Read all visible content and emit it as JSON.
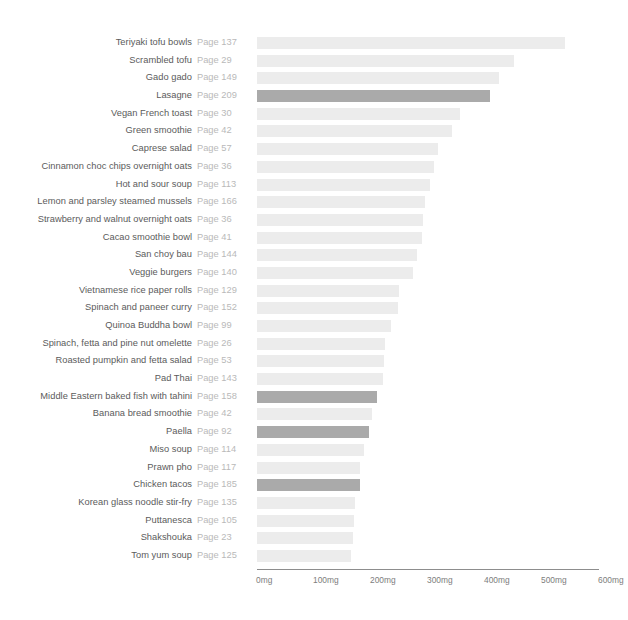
{
  "chart_data": {
    "type": "bar",
    "orientation": "horizontal",
    "title": "",
    "xlabel": "",
    "ylabel": "",
    "xlim": [
      0,
      600
    ],
    "unit": "mg",
    "grid": false,
    "legend": null,
    "axis": {
      "ticks": [
        0,
        100,
        200,
        300,
        400,
        500,
        600
      ],
      "tick_labels": [
        "0mg",
        "100mg",
        "200mg",
        "300mg",
        "400mg",
        "500mg",
        "600mg"
      ]
    },
    "colors": {
      "bar_default": "#ececec",
      "bar_highlight": "#aaaaaa",
      "label_text": "#5b5b5b",
      "page_text": "#b9b9b9",
      "axis_line": "#8d8d8d",
      "axis_text": "#7d7d7d",
      "background": "#ffffff"
    },
    "categories": [
      "Teriyaki tofu bowls",
      "Scrambled tofu",
      "Gado gado",
      "Lasagne",
      "Vegan French toast",
      "Green smoothie",
      "Caprese salad",
      "Cinnamon choc chips overnight oats",
      "Hot and sour soup",
      "Lemon and parsley steamed mussels",
      "Strawberry and walnut overnight oats",
      "Cacao smoothie bowl",
      "San choy bau",
      "Veggie burgers",
      "Vietnamese rice paper rolls",
      "Spinach and paneer curry",
      "Quinoa Buddha bowl",
      "Spinach, fetta and pine nut omelette",
      "Roasted pumpkin and fetta salad",
      "Pad Thai",
      "Middle Eastern baked fish with tahini",
      "Banana bread smoothie",
      "Paella",
      "Miso soup",
      "Prawn pho",
      "Chicken tacos",
      "Korean glass noodle stir-fry",
      "Puttanesca",
      "Shakshouka",
      "Tom yum soup"
    ],
    "values": [
      540,
      450,
      425,
      408,
      357,
      342,
      317,
      310,
      303,
      295,
      291,
      289,
      280,
      273,
      249,
      247,
      235,
      224,
      222,
      221,
      210,
      201,
      196,
      187,
      180,
      180,
      172,
      170,
      168,
      165
    ]
  },
  "rows": [
    {
      "label": "Teriyaki tofu bowls",
      "page": "Page 137",
      "value": 540,
      "highlight": false
    },
    {
      "label": "Scrambled tofu",
      "page": "Page 29",
      "value": 450,
      "highlight": false
    },
    {
      "label": "Gado gado",
      "page": "Page 149",
      "value": 425,
      "highlight": false
    },
    {
      "label": "Lasagne",
      "page": "Page 209",
      "value": 408,
      "highlight": true
    },
    {
      "label": "Vegan French toast",
      "page": "Page 30",
      "value": 357,
      "highlight": false
    },
    {
      "label": "Green smoothie",
      "page": "Page 42",
      "value": 342,
      "highlight": false
    },
    {
      "label": "Caprese salad",
      "page": "Page 57",
      "value": 317,
      "highlight": false
    },
    {
      "label": "Cinnamon choc chips overnight oats",
      "page": "Page 36",
      "value": 310,
      "highlight": false
    },
    {
      "label": "Hot and sour soup",
      "page": "Page 113",
      "value": 303,
      "highlight": false
    },
    {
      "label": "Lemon and parsley steamed mussels",
      "page": "Page 166",
      "value": 295,
      "highlight": false
    },
    {
      "label": "Strawberry and walnut overnight oats",
      "page": "Page 36",
      "value": 291,
      "highlight": false
    },
    {
      "label": "Cacao smoothie bowl",
      "page": "Page 41",
      "value": 289,
      "highlight": false
    },
    {
      "label": "San choy bau",
      "page": "Page 144",
      "value": 280,
      "highlight": false
    },
    {
      "label": "Veggie burgers",
      "page": "Page 140",
      "value": 273,
      "highlight": false
    },
    {
      "label": "Vietnamese rice paper rolls",
      "page": "Page 129",
      "value": 249,
      "highlight": false
    },
    {
      "label": "Spinach and paneer curry",
      "page": "Page 152",
      "value": 247,
      "highlight": false
    },
    {
      "label": "Quinoa Buddha bowl",
      "page": "Page 99",
      "value": 235,
      "highlight": false
    },
    {
      "label": "Spinach, fetta and pine nut omelette",
      "page": "Page 26",
      "value": 224,
      "highlight": false
    },
    {
      "label": "Roasted pumpkin and fetta salad",
      "page": "Page 53",
      "value": 222,
      "highlight": false
    },
    {
      "label": "Pad Thai",
      "page": "Page 143",
      "value": 221,
      "highlight": false
    },
    {
      "label": "Middle Eastern baked fish with tahini",
      "page": "Page 158",
      "value": 210,
      "highlight": true
    },
    {
      "label": "Banana bread smoothie",
      "page": "Page 42",
      "value": 201,
      "highlight": false
    },
    {
      "label": "Paella",
      "page": "Page 92",
      "value": 196,
      "highlight": true
    },
    {
      "label": "Miso soup",
      "page": "Page 114",
      "value": 187,
      "highlight": false
    },
    {
      "label": "Prawn pho",
      "page": "Page 117",
      "value": 180,
      "highlight": false
    },
    {
      "label": "Chicken tacos",
      "page": "Page 185",
      "value": 180,
      "highlight": true
    },
    {
      "label": "Korean glass noodle stir-fry",
      "page": "Page 135",
      "value": 172,
      "highlight": false
    },
    {
      "label": "Puttanesca",
      "page": "Page 105",
      "value": 170,
      "highlight": false
    },
    {
      "label": "Shakshouka",
      "page": "Page 23",
      "value": 168,
      "highlight": false
    },
    {
      "label": "Tom yum soup",
      "page": "Page 125",
      "value": 165,
      "highlight": false
    }
  ],
  "axis": {
    "ticks": [
      "0mg",
      "100mg",
      "200mg",
      "300mg",
      "400mg",
      "500mg",
      "600mg"
    ]
  }
}
